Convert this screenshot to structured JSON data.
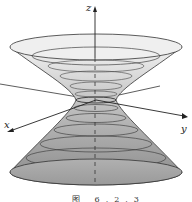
{
  "figure": {
    "caption": "图  6.2.3",
    "axes": {
      "x_label": "x",
      "y_label": "y",
      "z_label": "z"
    },
    "surface": "hyperboloid of one sheet",
    "colors": {
      "outline": "#333333",
      "fill_light": "#e6e6e6",
      "fill_dark": "#8c8c8c",
      "axis": "#222222"
    }
  }
}
